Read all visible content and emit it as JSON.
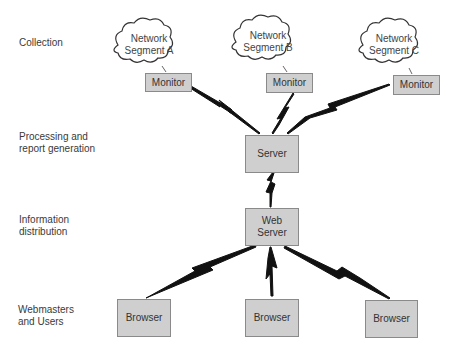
{
  "row_labels": {
    "collection": [
      "Collection"
    ],
    "processing": [
      "Processing and",
      "report generation"
    ],
    "distribution": [
      "Information",
      "distribution"
    ],
    "users": [
      "Webmasters",
      "and Users"
    ]
  },
  "network_segments": [
    {
      "lines": [
        "Network",
        "Segment A"
      ]
    },
    {
      "lines": [
        "Network",
        "Segment B"
      ]
    },
    {
      "lines": [
        "Network",
        "Segment C"
      ]
    }
  ],
  "monitors": [
    {
      "label": "Monitor"
    },
    {
      "label": "Monitor"
    },
    {
      "label": "Monitor"
    }
  ],
  "server": {
    "label": "Server"
  },
  "web_server": {
    "lines": [
      "Web",
      "Server"
    ]
  },
  "browsers": [
    {
      "label": "Browser"
    },
    {
      "label": "Browser"
    },
    {
      "label": "Browser"
    }
  ],
  "colors": {
    "box_fill": "#cfcfcf",
    "box_border": "#8a8a8a",
    "link": "#111111"
  }
}
